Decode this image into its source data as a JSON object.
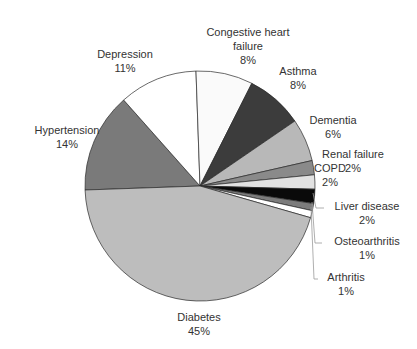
{
  "chart_data": {
    "type": "pie",
    "title": "",
    "categories": [
      "Hypertension",
      "Depression",
      "Congestive heart failure",
      "Asthma",
      "Dementia",
      "Renal failure",
      "COPD",
      "Liver disease",
      "Osteoarthritis",
      "Arthritis",
      "Diabetes"
    ],
    "values": [
      14,
      11,
      8,
      8,
      6,
      2,
      2,
      2,
      1,
      1,
      45
    ],
    "value_labels": [
      "14%",
      "11%",
      "8%",
      "8%",
      "6%",
      "2%",
      "2%",
      "2%",
      "1%",
      "1%",
      "45%"
    ],
    "colors": [
      "#7a7a7a",
      "#ffffff",
      "#fafafa",
      "#3c3c3c",
      "#b8b8b8",
      "#8a8a8a",
      "#e2e2e2",
      "#0a0a0a",
      "#7c7c7c",
      "#ffffff",
      "#bdbdbd"
    ],
    "legend": "none (data labels on slices)",
    "start_angle_deg": 178,
    "direction": "clockwise"
  },
  "labels": [
    {
      "name": "Hypertension",
      "pct": "14%",
      "x": 22,
      "y": 123,
      "w": 90
    },
    {
      "name": "Depression",
      "pct": "11%",
      "x": 85,
      "y": 47,
      "w": 80
    },
    {
      "name": "Congestive heart",
      "name2": "failure",
      "pct": "8%",
      "x": 193,
      "y": 25,
      "w": 110
    },
    {
      "name": "Asthma",
      "pct": "8%",
      "x": 268,
      "y": 64,
      "w": 60
    },
    {
      "name": "Dementia",
      "pct": "6%",
      "x": 300,
      "y": 113,
      "w": 66
    },
    {
      "name": "Renal failure",
      "pct": "2%",
      "x": 312,
      "y": 147,
      "w": 82
    },
    {
      "name": "COPD",
      "pct": "2%",
      "x": 310,
      "y": 161,
      "w": 40
    },
    {
      "name": "Liver disease",
      "pct": "2%",
      "x": 324,
      "y": 199,
      "w": 86
    },
    {
      "name": "Osteoarthritis",
      "pct": "1%",
      "x": 322,
      "y": 234,
      "w": 90
    },
    {
      "name": "Arthritis",
      "pct": "1%",
      "x": 316,
      "y": 270,
      "w": 60
    },
    {
      "name": "Diabetes",
      "pct": "45%",
      "x": 164,
      "y": 310,
      "w": 70
    }
  ]
}
